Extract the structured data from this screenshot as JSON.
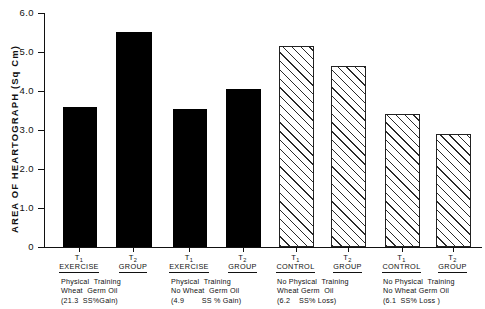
{
  "chart_data": {
    "type": "bar",
    "title": "",
    "subtitle": "",
    "xlabel": "",
    "ylabel": "AREA  OF  HEARTOGRAPH  (Sq Cm)",
    "ylim": [
      0,
      6.0
    ],
    "ytick_labels": [
      "6.0",
      "5.0",
      "4.0",
      "3.0",
      "2.0",
      "1.0",
      "0"
    ],
    "ytick_values": [
      6.0,
      5.0,
      4.0,
      3.0,
      2.0,
      1.0,
      0
    ],
    "grid": false,
    "legend_position": "none",
    "categories": [
      "T1 EXERCISE",
      "T2 GROUP",
      "T1 EXERCISE",
      "T2 GROUP",
      "T1 CONTROL",
      "T2 GROUP",
      "T1 CONTROL",
      "T2 GROUP"
    ],
    "values": [
      3.55,
      5.45,
      3.5,
      4.0,
      5.1,
      4.6,
      3.35,
      2.85
    ],
    "bar_styles": [
      "solid",
      "solid",
      "solid",
      "solid",
      "hatched",
      "hatched",
      "hatched",
      "hatched"
    ],
    "groups": [
      {
        "caption_lines": [
          "Physical  Training",
          "Wheat  Germ Oil",
          "(21.3  SS%Gain)"
        ],
        "bars": [
          {
            "t_symbol": "T",
            "t_sub": "1",
            "t_name": "EXERCISE",
            "value": 3.55
          },
          {
            "t_symbol": "T",
            "t_sub": "2",
            "t_name": "GROUP",
            "value": 5.45
          }
        ]
      },
      {
        "caption_lines": [
          "Physical  Training",
          "No Wheat  Germ Oil",
          "(4.9        SS % Gain)"
        ],
        "bars": [
          {
            "t_symbol": "T",
            "t_sub": "1",
            "t_name": "EXERCISE",
            "value": 3.5
          },
          {
            "t_symbol": "T",
            "t_sub": "2",
            "t_name": "GROUP",
            "value": 4.0
          }
        ]
      },
      {
        "caption_lines": [
          "No Physical  Training",
          "Wheat Germ  Oil",
          "(6.2    SS% Loss)"
        ],
        "bars": [
          {
            "t_symbol": "T",
            "t_sub": "1",
            "t_name": "CONTROL",
            "value": 5.1
          },
          {
            "t_symbol": "T",
            "t_sub": "2",
            "t_name": "GROUP",
            "value": 4.6
          }
        ]
      },
      {
        "caption_lines": [
          "No Physical  Training",
          "No Wheat Germ Oil",
          "(6.1  SS% Loss )"
        ],
        "bars": [
          {
            "t_symbol": "T",
            "t_sub": "1",
            "t_name": "CONTROL",
            "value": 3.35
          },
          {
            "t_symbol": "T",
            "t_sub": "2",
            "t_name": "GROUP",
            "value": 2.85
          }
        ]
      }
    ]
  },
  "colors": {
    "bar_solid": "#000000",
    "bar_hatch_line": "#2a2a2a",
    "bar_hatch_fill": "#ffffff",
    "axis": "#111111",
    "background": "#ffffff"
  }
}
